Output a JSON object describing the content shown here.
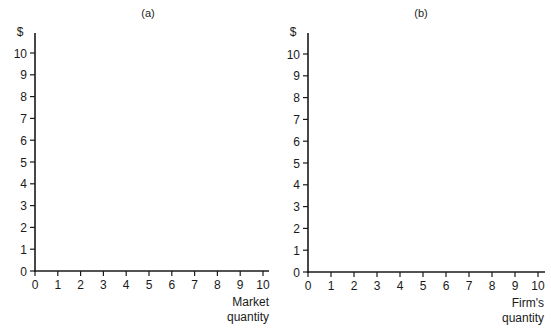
{
  "chart_data": [
    {
      "type": "line",
      "panel": "(a)",
      "title": "(a)",
      "xlabel": "Market quantity",
      "xlabel_lines": [
        "Market",
        "quantity"
      ],
      "ylabel": "$",
      "xlim": [
        0,
        10
      ],
      "ylim": [
        0,
        10
      ],
      "x_ticks": [
        0,
        1,
        2,
        3,
        4,
        5,
        6,
        7,
        8,
        9,
        10
      ],
      "y_ticks": [
        0,
        1,
        2,
        3,
        4,
        5,
        6,
        7,
        8,
        9,
        10
      ],
      "grid": false,
      "series": []
    },
    {
      "type": "line",
      "panel": "(b)",
      "title": "(b)",
      "xlabel": "Firm's quantity",
      "xlabel_lines": [
        "Firm's",
        "quantity"
      ],
      "ylabel": "$",
      "xlim": [
        0,
        10
      ],
      "ylim": [
        0,
        10
      ],
      "x_ticks": [
        0,
        1,
        2,
        3,
        4,
        5,
        6,
        7,
        8,
        9,
        10
      ],
      "y_ticks": [
        0,
        1,
        2,
        3,
        4,
        5,
        6,
        7,
        8,
        9,
        10
      ],
      "grid": false,
      "series": []
    }
  ],
  "layout": {
    "panels": [
      {
        "origin_x": 35,
        "origin_y": 271,
        "step_x": 22.8,
        "step_y": 21.8,
        "axis_top": 33,
        "axis_right": 269,
        "title_x": 148,
        "title_y": 17
      },
      {
        "origin_x": 308,
        "origin_y": 272,
        "step_x": 23.0,
        "step_y": 21.8,
        "axis_top": 33,
        "axis_right": 545,
        "title_x": 421,
        "title_y": 17
      }
    ],
    "axis_color": "#1a1a1a"
  }
}
